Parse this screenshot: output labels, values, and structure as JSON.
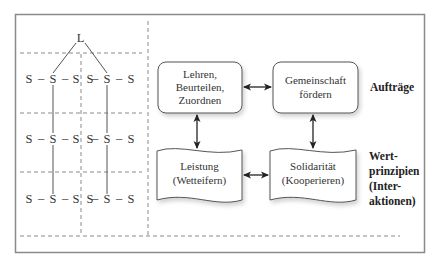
{
  "tree": {
    "leader": "L",
    "node": "S",
    "dash": "–",
    "rows": [
      [
        "S",
        "S",
        "S",
        "S",
        "S",
        "S"
      ],
      [
        "S",
        "S",
        "S",
        "S",
        "S",
        "S"
      ],
      [
        "S",
        "S",
        "S",
        "S",
        "S",
        "S"
      ]
    ]
  },
  "boxes": {
    "top_left": [
      "Lehren,",
      "Beurteilen,",
      "Zuordnen"
    ],
    "top_right": [
      "Gemeinschaft",
      "fördern"
    ],
    "bottom_left": [
      "Leistung",
      "(Wetteifern)"
    ],
    "bottom_right": [
      "Solidarität",
      "(Kooperieren)"
    ]
  },
  "side_labels": {
    "auftraege": "Aufträge",
    "wertprinzipien": [
      "Wert-",
      "prinzipien",
      "(Inter-",
      "aktionen)"
    ]
  },
  "colors": {
    "frame": "#8a8a8a",
    "dash": "#8a8a8a",
    "line": "#555555",
    "box_border": "#555555",
    "text": "#333333"
  }
}
